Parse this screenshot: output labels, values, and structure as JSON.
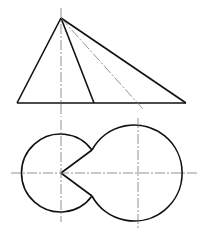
{
  "diagram": {
    "title": "",
    "colors": {
      "line": "#111111",
      "center_line": "#666666",
      "background": "#ffffff"
    },
    "front_view": {
      "apex": [
        61,
        18
      ],
      "base_left": [
        17,
        103
      ],
      "base_right": [
        186,
        103
      ],
      "inner_generator_end": [
        94,
        103
      ],
      "hidden_dashdot_end": [
        143,
        108
      ]
    },
    "top_view": {
      "small_circle": {
        "center": [
          61,
          173
        ],
        "r": 39
      },
      "large_circle": {
        "center": [
          138,
          173
        ],
        "r": 48
      },
      "notch_vertex": [
        61,
        173
      ],
      "tangent_upper": [
        93,
        150
      ],
      "tangent_lower": [
        93,
        196
      ]
    },
    "center_lines": {
      "vertical_left_x": 61,
      "vertical_right_x": 138,
      "horizontal_y": 173
    }
  }
}
